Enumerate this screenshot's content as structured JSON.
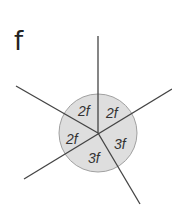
{
  "panel": {
    "label": "f"
  },
  "diagram": {
    "center": [
      98,
      133
    ],
    "circle_radius": 39,
    "circle_fill": "#dedede",
    "circle_stroke": "#999999",
    "line_color": "#444444",
    "regions": [
      {
        "label": "2f",
        "position": "upper-left"
      },
      {
        "label": "2f",
        "position": "upper-right"
      },
      {
        "label": "2f",
        "position": "left"
      },
      {
        "label": "3f",
        "position": "right"
      },
      {
        "label": "3f",
        "position": "bottom"
      }
    ]
  }
}
